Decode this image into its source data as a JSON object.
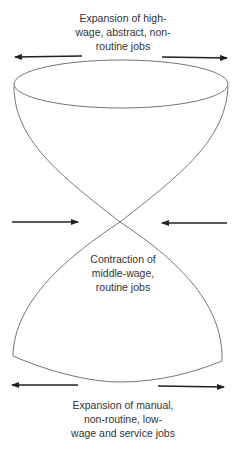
{
  "diagram": {
    "top_label": {
      "lines": [
        "Expansion of high-",
        "wage, abstract, non-",
        "routine jobs"
      ]
    },
    "middle_label": {
      "lines": [
        "Contraction of",
        "middle-wage,",
        "routine jobs"
      ]
    },
    "bottom_label": {
      "lines": [
        "Expansion of manual,",
        "non-routine, low-",
        "wage and service jobs"
      ]
    },
    "arrows": [
      {
        "position": "top-left",
        "direction": "outward"
      },
      {
        "position": "top-right",
        "direction": "outward"
      },
      {
        "position": "middle-left",
        "direction": "inward"
      },
      {
        "position": "middle-right",
        "direction": "inward"
      },
      {
        "position": "bottom-left",
        "direction": "outward"
      },
      {
        "position": "bottom-right",
        "direction": "outward"
      }
    ],
    "colors": {
      "stroke": "#555555",
      "arrow": "#222222",
      "text": "#333333"
    }
  }
}
